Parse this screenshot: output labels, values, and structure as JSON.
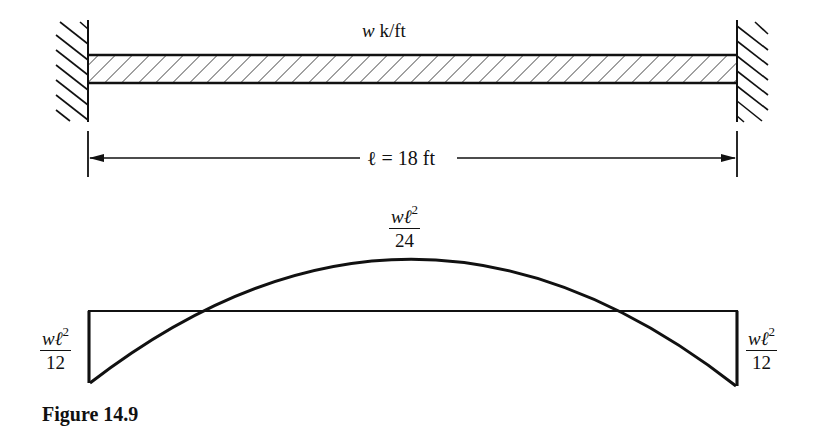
{
  "figure": {
    "caption": "Figure 14.9",
    "beam": {
      "load_label_var": "w",
      "load_label_unit": " k/ft",
      "span_label": "ℓ = 18 ft",
      "span_value_ft": 18,
      "supports": [
        "fixed-left",
        "fixed-right"
      ]
    },
    "moment_diagram": {
      "midspan_label": {
        "numerator_var": "wℓ",
        "exponent": "2",
        "denominator": "24"
      },
      "left_end_label": {
        "numerator_var": "wℓ",
        "exponent": "2",
        "denominator": "12"
      },
      "right_end_label": {
        "numerator_var": "wℓ",
        "exponent": "2",
        "denominator": "12"
      }
    }
  }
}
